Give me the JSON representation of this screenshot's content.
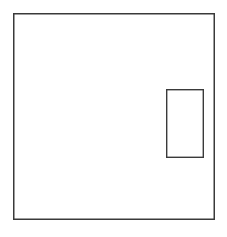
{
  "canvas": {
    "width": 227,
    "height": 237,
    "background_color": "#ffffff"
  },
  "figure": {
    "type": "line-drawing",
    "stroke_color": "#3a3a3a",
    "stroke_width": 1.4,
    "fill": "none",
    "shapes": [
      {
        "name": "outer-rectangle",
        "kind": "rectangle",
        "x": 13,
        "y": 13,
        "width": 202,
        "height": 207,
        "right": 215,
        "bottom": 220,
        "stroke_color": "#3a3a3a",
        "stroke_width": 1.5,
        "fill": "none"
      },
      {
        "name": "inner-rectangle",
        "kind": "rectangle",
        "x": 166,
        "y": 89,
        "width": 38,
        "height": 69,
        "right": 204,
        "bottom": 158,
        "stroke_color": "#3a3a3a",
        "stroke_width": 1.4,
        "fill": "none"
      }
    ]
  }
}
